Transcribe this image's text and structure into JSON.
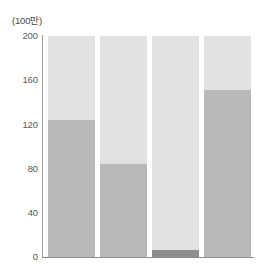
{
  "chart_data": {
    "type": "bar",
    "title": "",
    "subtitle": "",
    "unit_label": "(100만)",
    "xlabel": "",
    "ylabel": "",
    "ylim": [
      0,
      200
    ],
    "ytick_values": [
      200,
      160,
      120,
      80,
      40,
      0
    ],
    "ytick_labels": [
      "200",
      "160",
      "120",
      "80",
      "40",
      "0"
    ],
    "grid": false,
    "legend": null,
    "stacked": true,
    "categories": [
      "1",
      "2",
      "3",
      "4"
    ],
    "series": [
      {
        "name": "lower-dark",
        "color": "#8e8e8e",
        "values": [
          0,
          0,
          6,
          0
        ]
      },
      {
        "name": "lower-mid",
        "color": "#b9b9b9",
        "values": [
          124,
          84,
          0,
          151
        ]
      },
      {
        "name": "upper-light",
        "color": "#e2e2e2",
        "values": [
          76,
          116,
          194,
          49
        ]
      }
    ],
    "bar_totals": [
      200,
      200,
      200,
      200
    ],
    "colors": {
      "light": "#e2e2e2",
      "medium": "#b9b9b9",
      "dark": "#8e8e8e",
      "axis": "#8f8f8f",
      "tick_text": "#5a5a5a",
      "unit_text": "#4a4a4a",
      "background": "#ffffff"
    }
  }
}
